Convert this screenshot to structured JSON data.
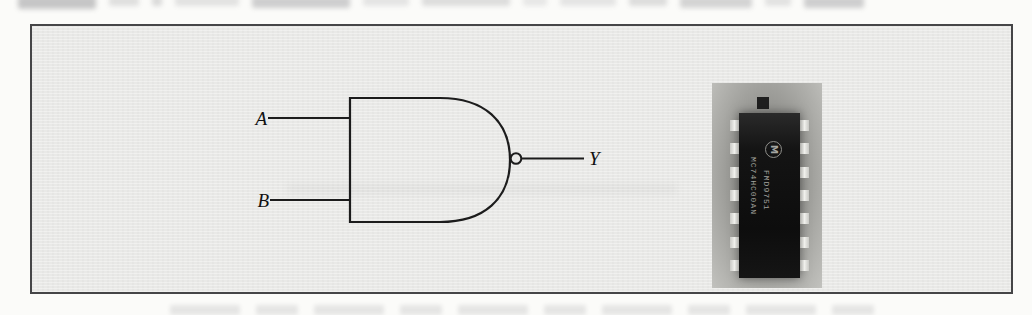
{
  "figure": {
    "type": "NAND gate schematic with IC package photo",
    "gate": {
      "name": "NAND",
      "input_a_label": "A",
      "input_b_label": "B",
      "output_label": "Y"
    },
    "chip_photo": {
      "logo_letter": "M",
      "marking_line1": "MC74HC00AN",
      "marking_line2": "FMD9751",
      "pins_per_side": 7
    },
    "colors": {
      "box_fill": "#e9e9e7",
      "box_border": "#454547",
      "schematic_line": "#1c1c1c",
      "chip_body": "#121212",
      "photo_background": "#a2a29e",
      "page_background": "#fbfbf9"
    }
  }
}
